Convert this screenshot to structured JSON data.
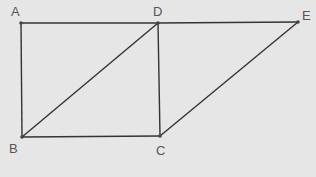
{
  "diagram": {
    "background": "#e6e6e6",
    "line_color": "#333333",
    "point_color": "#444444",
    "label_color": "#555555",
    "points": {
      "A": {
        "label": "A",
        "x": 21,
        "y": 23,
        "lx": 11,
        "ly": 16
      },
      "D": {
        "label": "D",
        "x": 158,
        "y": 23,
        "lx": 153,
        "ly": 16
      },
      "E": {
        "label": "E",
        "x": 298,
        "y": 22,
        "lx": 302,
        "ly": 20
      },
      "B": {
        "label": "B",
        "x": 22,
        "y": 137,
        "lx": 9,
        "ly": 153
      },
      "C": {
        "label": "C",
        "x": 160,
        "y": 136,
        "lx": 156,
        "ly": 155
      }
    },
    "segments": [
      [
        "A",
        "D"
      ],
      [
        "D",
        "E"
      ],
      [
        "A",
        "B"
      ],
      [
        "B",
        "C"
      ],
      [
        "D",
        "C"
      ],
      [
        "B",
        "D"
      ],
      [
        "C",
        "E"
      ]
    ]
  }
}
